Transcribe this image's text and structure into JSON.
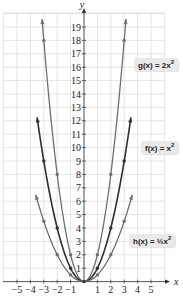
{
  "chart_data": {
    "type": "line",
    "title": "",
    "xlabel": "x",
    "ylabel": "y",
    "xlim": [
      -6,
      6
    ],
    "ylim": [
      0,
      20
    ],
    "grid": true,
    "x_ticks": [
      -5,
      -4,
      -3,
      -2,
      -1,
      1,
      2,
      3,
      4,
      5
    ],
    "y_ticks": [
      1,
      2,
      3,
      4,
      5,
      6,
      7,
      8,
      9,
      10,
      11,
      12,
      13,
      14,
      15,
      16,
      17,
      18,
      19
    ],
    "series": [
      {
        "name": "g(x) = 2x²",
        "label_text": "g(x) = 2x",
        "label_sup": "2",
        "function": "2*x^2",
        "color": "#6f6f6f",
        "x_range": [
          -3.13,
          3.13
        ],
        "points": [
          [
            -3,
            18
          ],
          [
            -2,
            8
          ],
          [
            -1,
            2
          ],
          [
            0,
            0
          ],
          [
            1,
            2
          ],
          [
            2,
            8
          ],
          [
            3,
            18
          ]
        ]
      },
      {
        "name": "f(x) = x²",
        "label_text": "f(x) = x",
        "label_sup": "2",
        "function": "x^2",
        "color": "#2e2e2e",
        "x_range": [
          -3.5,
          3.5
        ],
        "points": [
          [
            -3,
            9
          ],
          [
            -2,
            4
          ],
          [
            -1,
            1
          ],
          [
            0,
            0
          ],
          [
            1,
            1
          ],
          [
            2,
            4
          ],
          [
            3,
            9
          ]
        ]
      },
      {
        "name": "h(x) = ½x²",
        "label_text": "h(x) = ",
        "label_frac": "½",
        "label_tail": "x",
        "label_sup": "2",
        "function": "0.5*x^2",
        "color": "#6f6f6f",
        "x_range": [
          -3.6,
          3.6
        ],
        "points": [
          [
            -3,
            4.5
          ],
          [
            -2,
            2
          ],
          [
            -1,
            0.5
          ],
          [
            0,
            0
          ],
          [
            1,
            0.5
          ],
          [
            2,
            2
          ],
          [
            3,
            4.5
          ]
        ]
      }
    ]
  }
}
